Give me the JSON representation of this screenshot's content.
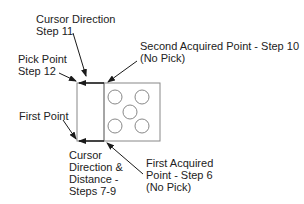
{
  "labels": {
    "cursor_direction": [
      "Cursor Direction",
      "Step 11"
    ],
    "pick_point": [
      "Pick Point",
      "Step 12"
    ],
    "second_acquired": [
      "Second Acquired Point - Step 10",
      "(No Pick)"
    ],
    "first_point": "First Point",
    "cursor_distance": [
      "Cursor",
      "Direction &",
      "Distance -",
      "Steps 7-9"
    ],
    "first_acquired": [
      "First Acquired",
      "Point - Step 6",
      "(No Pick)"
    ]
  },
  "colors": {
    "line": "#888888",
    "arrow": "#1a1a1a",
    "text": "#222222"
  }
}
